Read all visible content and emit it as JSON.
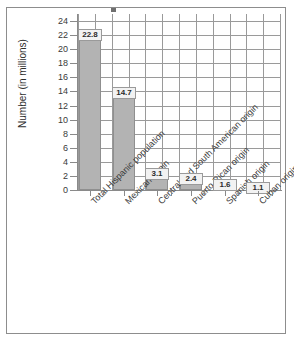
{
  "figure": {
    "y_axis_title": "Number (in millions)"
  },
  "chart_data": {
    "type": "bar",
    "title": "",
    "xlabel": "",
    "ylabel": "Number (in millions)",
    "ylim": [
      0,
      25
    ],
    "ytick_step": 2,
    "grid": true,
    "legend": "none",
    "categories": [
      "Total Hispanic population",
      "Mexican origin",
      "Central and South American origin",
      "Puerto Rican origin",
      "Spanish origin",
      "Cuban origin"
    ],
    "values": [
      22.8,
      14.7,
      3.1,
      2.4,
      1.6,
      1.1
    ],
    "value_labels": [
      "22.8",
      "14.7",
      "3.1",
      "2.4",
      "1.6",
      "1.1"
    ],
    "yticks": [
      "0",
      "2",
      "4",
      "6",
      "8",
      "10",
      "12",
      "14",
      "16",
      "18",
      "20",
      "22",
      "24"
    ],
    "bar_color": "#b3b3b3",
    "grid_color": "#9a9a9a",
    "axis_color": "#8a8a8a"
  }
}
